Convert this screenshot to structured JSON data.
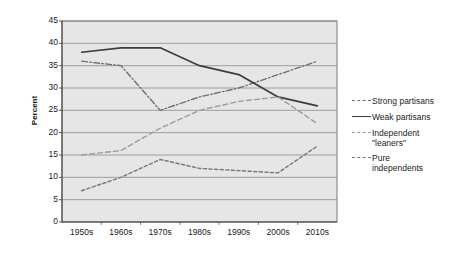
{
  "chart_data": {
    "type": "line",
    "title": "",
    "xlabel": "",
    "ylabel": "Percent",
    "categories": [
      "1950s",
      "1960s",
      "1970s",
      "1980s",
      "1990s",
      "2000s",
      "2010s"
    ],
    "ylim": [
      0,
      45
    ],
    "ytick_step": 5,
    "yticks": [
      45,
      40,
      35,
      30,
      25,
      20,
      15,
      10,
      5,
      0
    ],
    "grid": true,
    "legend_position": "right",
    "series": [
      {
        "name": "Strong partisans",
        "style": "dash-dot",
        "color": "#6e6e6e",
        "values": [
          36,
          35,
          25,
          28,
          30,
          33,
          36
        ]
      },
      {
        "name": "Weak partisans",
        "style": "solid",
        "color": "#3d3d3d",
        "values": [
          38,
          39,
          39,
          35,
          33,
          28,
          26
        ]
      },
      {
        "name": "Independent \"leaners\"",
        "style": "dashed",
        "color": "#9a9a9a",
        "values": [
          15,
          16,
          21,
          25,
          27,
          28,
          22
        ]
      },
      {
        "name": "Pure independents",
        "style": "dotted",
        "color": "#7a7a7a",
        "values": [
          7,
          10,
          14,
          12,
          11.5,
          11,
          17
        ]
      }
    ]
  },
  "legend": {
    "items": [
      {
        "label": "Strong partisans",
        "swatch": "dash-dot-swatch"
      },
      {
        "label": "Weak partisans",
        "swatch": "solid-swatch"
      },
      {
        "label": "Independent\n\"leaners\"",
        "swatch": "dashed-swatch"
      },
      {
        "label": "Pure\nindependents",
        "swatch": "dotted-swatch"
      }
    ]
  },
  "plot": {
    "background_color": "#e6e6e6",
    "gridline_color": "#8c8c8c",
    "border_color": "#7a7a7a"
  }
}
